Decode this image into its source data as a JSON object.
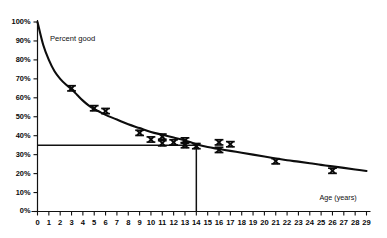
{
  "chart_data": {
    "type": "line",
    "title": "",
    "subtitle": "",
    "xlabel": "Age (years)",
    "ylabel": "Percent good",
    "xlim": [
      0,
      29
    ],
    "ylim": [
      0,
      100
    ],
    "grid": false,
    "legend": "none",
    "x_tick_labels": [
      "0",
      "1",
      "2",
      "3",
      "4",
      "5",
      "6",
      "7",
      "8",
      "9",
      "10",
      "11",
      "12",
      "13",
      "14",
      "15",
      "16",
      "17",
      "18",
      "19",
      "20",
      "21",
      "22",
      "23",
      "24",
      "25",
      "26",
      "27",
      "28",
      "29"
    ],
    "x_tick_values": [
      0,
      1,
      2,
      3,
      4,
      5,
      6,
      7,
      8,
      9,
      10,
      11,
      12,
      13,
      14,
      15,
      16,
      17,
      18,
      19,
      20,
      21,
      22,
      23,
      24,
      25,
      26,
      27,
      28,
      29
    ],
    "y_tick_labels": [
      "0%",
      "10%",
      "20%",
      "30%",
      "40%",
      "50%",
      "60%",
      "70%",
      "80%",
      "90%",
      "100%"
    ],
    "y_tick_values": [
      0,
      10,
      20,
      30,
      40,
      50,
      60,
      70,
      80,
      90,
      100
    ],
    "series": [
      {
        "name": "fitted-curve",
        "type": "line",
        "marker": "none",
        "x": [
          0,
          0.5,
          1,
          1.5,
          2,
          2.5,
          3,
          3.5,
          4,
          4.5,
          5,
          5.5,
          6,
          7,
          8,
          9,
          10,
          11,
          12,
          13,
          14,
          15,
          16,
          17,
          18,
          19,
          20,
          21,
          22,
          23,
          24,
          25,
          26,
          27,
          28,
          29
        ],
        "y": [
          100,
          88,
          80,
          74,
          70,
          67,
          64.5,
          61.5,
          58.5,
          56,
          54,
          52.5,
          51,
          48.5,
          46,
          44,
          42,
          40.5,
          39,
          37.5,
          35.5,
          34,
          33,
          32,
          31,
          30,
          29,
          28,
          27,
          26.3,
          25.5,
          24.6,
          23.8,
          23,
          22.2,
          21.4
        ]
      },
      {
        "name": "observed-points",
        "type": "scatter",
        "marker": "x",
        "x": [
          3,
          5,
          6,
          9,
          10,
          11,
          11,
          12,
          13,
          13,
          14,
          16,
          16,
          17,
          21,
          26
        ],
        "y": [
          65,
          54.5,
          53,
          41.5,
          38,
          39.5,
          36,
          36.5,
          37.5,
          35,
          34.5,
          36.5,
          32.5,
          35.5,
          26.5,
          21.5
        ]
      }
    ],
    "reference_lines": [
      {
        "name": "horizontal-threshold",
        "orientation": "horizontal",
        "value": 35,
        "from_x": 0,
        "to_x": 14
      },
      {
        "name": "vertical-threshold",
        "orientation": "vertical",
        "value": 14,
        "from_y": 0,
        "to_y": 35
      }
    ],
    "annotations": [
      {
        "name": "y-axis-annotation",
        "text": "Percent good",
        "x": 1.1,
        "y": 93
      },
      {
        "name": "x-axis-annotation",
        "text": "Age (years)",
        "x": 26.5,
        "y": 9
      }
    ]
  }
}
